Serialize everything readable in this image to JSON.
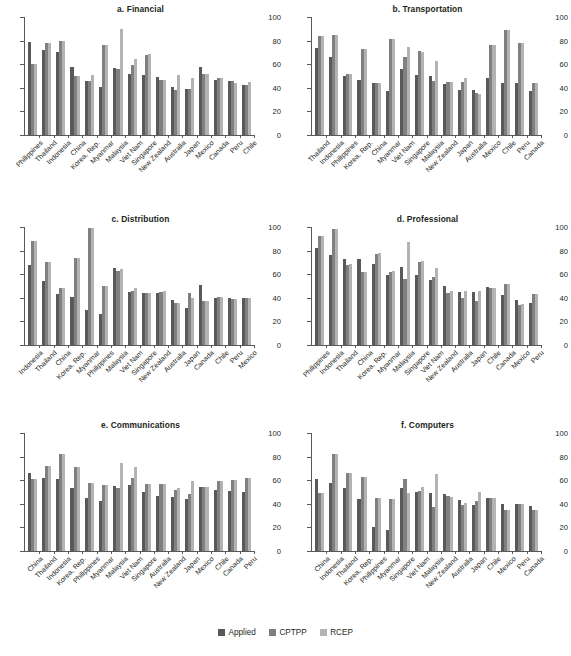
{
  "figure": {
    "legend": [
      {
        "key": "applied",
        "label": "Applied",
        "color": "#595959"
      },
      {
        "key": "cptpp",
        "label": "CPTPP",
        "color": "#808080"
      },
      {
        "key": "rcep",
        "label": "RCEP",
        "color": "#b3b3b3"
      }
    ],
    "y_ticks": [
      "0",
      "20",
      "40",
      "60",
      "80",
      "100"
    ]
  },
  "chart_data": [
    {
      "type": "bar",
      "panel": "a",
      "title": "a. Financial",
      "xlabel": "",
      "ylabel": "",
      "ylim": [
        0,
        100
      ],
      "yticks": [
        0,
        20,
        40,
        60,
        80,
        100
      ],
      "grid": false,
      "legend_position": "bottom",
      "categories": [
        "Philippines",
        "Thailand",
        "Indonesia",
        "China",
        "Korea, Rep.",
        "Myanmar",
        "Malaysia",
        "Viet Nam",
        "Singapore",
        "New Zealand",
        "Australia",
        "Japan",
        "Mexico",
        "Canada",
        "Peru",
        "Chile"
      ],
      "series": [
        {
          "name": "Applied",
          "values": [
            79,
            72,
            70,
            58,
            46,
            41,
            57,
            52,
            51,
            49,
            41,
            39,
            58,
            47,
            46,
            42
          ]
        },
        {
          "name": "CPTPP",
          "values": [
            60,
            78,
            80,
            50,
            46,
            76,
            56,
            59,
            68,
            47,
            38,
            39,
            52,
            48,
            46,
            42
          ]
        },
        {
          "name": "RCEP",
          "values": [
            60,
            78,
            80,
            50,
            51,
            76,
            90,
            64,
            69,
            47,
            51,
            48,
            52,
            48,
            44,
            45
          ]
        }
      ]
    },
    {
      "type": "bar",
      "panel": "b",
      "title": "b. Transportation",
      "xlabel": "",
      "ylabel": "",
      "ylim": [
        0,
        100
      ],
      "yticks": [
        0,
        20,
        40,
        60,
        80,
        100
      ],
      "grid": false,
      "legend_position": "bottom",
      "categories": [
        "Thailand",
        "Indonesia",
        "Philippines",
        "Korea, Rep.",
        "China",
        "Myanmar",
        "Viet Nam",
        "Singapore",
        "Malaysia",
        "New Zealand",
        "Japan",
        "Australia",
        "Mexico",
        "Chile",
        "Peru",
        "Canada"
      ],
      "series": [
        {
          "name": "Applied",
          "values": [
            74,
            66,
            50,
            47,
            44,
            37,
            56,
            51,
            50,
            43,
            38,
            38,
            48,
            44,
            44,
            37
          ]
        },
        {
          "name": "CPTPP",
          "values": [
            84,
            85,
            52,
            73,
            44,
            81,
            66,
            71,
            46,
            45,
            45,
            36,
            76,
            89,
            78,
            44
          ]
        },
        {
          "name": "RCEP",
          "values": [
            84,
            85,
            52,
            73,
            44,
            81,
            75,
            70,
            63,
            45,
            48,
            35,
            76,
            89,
            78,
            44
          ]
        }
      ]
    },
    {
      "type": "bar",
      "panel": "c",
      "title": "c. Distribution",
      "xlabel": "",
      "ylabel": "",
      "ylim": [
        0,
        100
      ],
      "yticks": [
        0,
        20,
        40,
        60,
        80,
        100
      ],
      "grid": false,
      "legend_position": "bottom",
      "categories": [
        "Indonesia",
        "Thailand",
        "China",
        "Korea, Rep.",
        "Myanmar",
        "Philippines",
        "Malaysia",
        "Viet Nam",
        "Singapore",
        "New Zealand",
        "Australia",
        "Japan",
        "Canada",
        "Chile",
        "Peru",
        "Mexico"
      ],
      "series": [
        {
          "name": "Applied",
          "values": [
            68,
            54,
            43,
            41,
            30,
            26,
            65,
            45,
            44,
            44,
            38,
            31,
            51,
            40,
            40,
            40
          ]
        },
        {
          "name": "CPTPP",
          "values": [
            88,
            70,
            48,
            74,
            99,
            50,
            63,
            46,
            44,
            45,
            36,
            44,
            37,
            41,
            39,
            40
          ]
        },
        {
          "name": "RCEP",
          "values": [
            88,
            70,
            48,
            74,
            99,
            50,
            64,
            48,
            44,
            46,
            36,
            40,
            37,
            41,
            39,
            40
          ]
        }
      ]
    },
    {
      "type": "bar",
      "panel": "d",
      "title": "d. Professional",
      "xlabel": "",
      "ylabel": "",
      "ylim": [
        0,
        100
      ],
      "yticks": [
        0,
        20,
        40,
        60,
        80,
        100
      ],
      "grid": false,
      "legend_position": "bottom",
      "categories": [
        "Philippines",
        "Indonesia",
        "Thailand",
        "China",
        "Korea, Rep.",
        "Myanmar",
        "Malaysia",
        "Singapore",
        "Viet Nam",
        "New Zealand",
        "Australia",
        "Japan",
        "Chile",
        "Canada",
        "Mexico",
        "Peru"
      ],
      "series": [
        {
          "name": "Applied",
          "values": [
            82,
            76,
            73,
            73,
            69,
            59,
            66,
            59,
            55,
            50,
            45,
            45,
            49,
            42,
            38,
            36
          ]
        },
        {
          "name": "CPTPP",
          "values": [
            92,
            98,
            68,
            62,
            77,
            62,
            56,
            70,
            58,
            44,
            40,
            37,
            48,
            52,
            34,
            43
          ]
        },
        {
          "name": "RCEP",
          "values": [
            92,
            98,
            69,
            62,
            78,
            63,
            87,
            71,
            65,
            46,
            46,
            46,
            48,
            52,
            35,
            43
          ]
        }
      ]
    },
    {
      "type": "bar",
      "panel": "e",
      "title": "e. Communications",
      "xlabel": "",
      "ylabel": "",
      "ylim": [
        0,
        100
      ],
      "yticks": [
        0,
        20,
        40,
        60,
        80,
        100
      ],
      "grid": false,
      "legend_position": "bottom",
      "categories": [
        "China",
        "Thailand",
        "Indonesia",
        "Korea, Rep.",
        "Philippines",
        "Myanmar",
        "Malaysia",
        "Viet Nam",
        "Singapore",
        "Australia",
        "New Zealand",
        "Japan",
        "Mexico",
        "Chile",
        "Canada",
        "Peru"
      ],
      "series": [
        {
          "name": "Applied",
          "values": [
            66,
            62,
            61,
            53,
            45,
            42,
            55,
            56,
            50,
            47,
            46,
            44,
            54,
            52,
            51,
            50
          ]
        },
        {
          "name": "CPTPP",
          "values": [
            61,
            72,
            82,
            71,
            58,
            56,
            53,
            62,
            57,
            57,
            52,
            48,
            54,
            59,
            60,
            62
          ]
        },
        {
          "name": "RCEP",
          "values": [
            61,
            72,
            82,
            71,
            58,
            56,
            75,
            71,
            57,
            57,
            53,
            59,
            54,
            59,
            60,
            62
          ]
        }
      ]
    },
    {
      "type": "bar",
      "panel": "f",
      "title": "f. Computers",
      "xlabel": "",
      "ylabel": "",
      "ylim": [
        0,
        100
      ],
      "yticks": [
        0,
        20,
        40,
        60,
        80,
        100
      ],
      "grid": false,
      "legend_position": "bottom",
      "categories": [
        "China",
        "Indonesia",
        "Thailand",
        "Korea, Rep.",
        "Philippines",
        "Myanmar",
        "Singapore",
        "Viet Nam",
        "Malaysia",
        "New Zealand",
        "Australia",
        "Japan",
        "Chile",
        "Mexico",
        "Peru",
        "Canada"
      ],
      "series": [
        {
          "name": "Applied",
          "values": [
            61,
            58,
            53,
            44,
            20,
            18,
            53,
            50,
            49,
            48,
            43,
            39,
            45,
            40,
            40,
            38
          ]
        },
        {
          "name": "CPTPP",
          "values": [
            49,
            82,
            66,
            63,
            45,
            44,
            61,
            51,
            37,
            47,
            39,
            42,
            45,
            35,
            40,
            35
          ]
        },
        {
          "name": "RCEP",
          "values": [
            49,
            82,
            66,
            63,
            45,
            44,
            49,
            54,
            65,
            46,
            41,
            50,
            45,
            35,
            40,
            35
          ]
        }
      ]
    }
  ]
}
